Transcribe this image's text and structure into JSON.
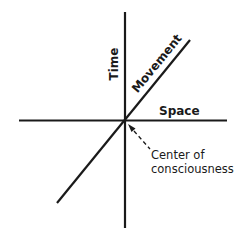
{
  "diagram": {
    "axes": {
      "vertical": {
        "label": "Time"
      },
      "horizontal": {
        "label": "Space"
      },
      "diagonal": {
        "label": "Movement"
      }
    },
    "annotation": {
      "line1": "Center of",
      "line2": "consciousness",
      "pointer_style": "dashed-arrow"
    },
    "colors": {
      "ink": "#1a1a1a",
      "background": "#ffffff"
    }
  }
}
